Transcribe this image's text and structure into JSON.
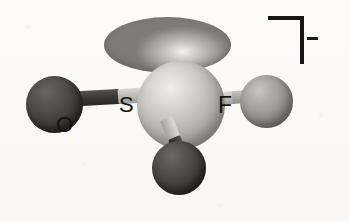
{
  "figure": {
    "title": "Fluorosulfite anion ball-and-stick model",
    "background_color": "#fbfaf7",
    "charge": {
      "bracket": "right-angle-bracket",
      "sign": "−",
      "sign_label": "minus",
      "description": "Square bracket with superscript minus denoting an anion"
    },
    "atoms": [
      {
        "id": "S",
        "label": "S",
        "element_name": "sulfur",
        "color": "#bcb9b4",
        "role": "central-atom",
        "position": {
          "x": 181,
          "y": 105
        },
        "radius": 44
      },
      {
        "id": "O1",
        "label": "O",
        "element_name": "oxygen",
        "color": "#3a3733",
        "role": "terminal-atom",
        "position": {
          "x": 55,
          "y": 105
        },
        "radius": 29
      },
      {
        "id": "O2",
        "label": "",
        "element_name": "oxygen",
        "color": "#3a3733",
        "role": "terminal-atom",
        "position": {
          "x": 179,
          "y": 168
        },
        "radius": 27
      },
      {
        "id": "F",
        "label": "F",
        "element_name": "fluorine",
        "color": "#9e9b96",
        "role": "terminal-atom",
        "position": {
          "x": 266,
          "y": 102
        },
        "radius": 27
      }
    ],
    "bonds": [
      {
        "from": "S",
        "to": "O1",
        "type": "single",
        "style": "two-tone-cylinder"
      },
      {
        "from": "S",
        "to": "F",
        "type": "single",
        "style": "two-tone-cylinder"
      },
      {
        "from": "S",
        "to": "O2",
        "type": "single",
        "style": "two-tone-cylinder"
      }
    ],
    "orbital": {
      "name": "lone-pair-lobe",
      "shape": "flattened-ellipsoid",
      "color": "#a3a09b",
      "position": {
        "x": 167,
        "y": 45
      },
      "width": 127,
      "height": 56
    },
    "labels": {
      "oxygen": "O",
      "sulfur": "S",
      "fluorine": "F"
    }
  }
}
